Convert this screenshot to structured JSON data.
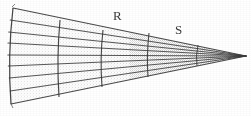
{
  "figure": {
    "kind": "line-drawing",
    "background_color": "#ffffff",
    "ink_color": "#2e2e2e",
    "labels": [
      {
        "id": "R",
        "text": "R",
        "x": 113,
        "y": 9
      },
      {
        "id": "S",
        "text": "S",
        "x": 175,
        "y": 23
      }
    ],
    "apex": {
      "x": 246,
      "y": 56
    },
    "left_arc": {
      "top": {
        "x": 13,
        "y": 8
      },
      "bottom": {
        "x": 11,
        "y": 104
      },
      "bulge": -5
    },
    "generators": {
      "count": 9,
      "left_y": [
        8,
        20,
        32,
        43,
        55,
        66,
        78,
        91,
        104
      ],
      "description": "Straight lines from each point on the left arc converging to the apex"
    },
    "cross_arcs": [
      {
        "id": "arc-1",
        "x": 59,
        "top_y": 20,
        "bottom_y": 97,
        "bulge": -3
      },
      {
        "id": "arc-2",
        "x": 102,
        "top_y": 30,
        "bottom_y": 87,
        "bulge": -3
      },
      {
        "id": "arc-3",
        "x": 148,
        "top_y": 33,
        "bottom_y": 77,
        "bulge": -2
      },
      {
        "id": "arc-4",
        "x": 197,
        "top_y": 45,
        "bottom_y": 66,
        "bulge": -2
      }
    ],
    "stipple": {
      "enabled": true,
      "description": "Dotted shading fill between generator lines, densest toward the right half"
    }
  }
}
